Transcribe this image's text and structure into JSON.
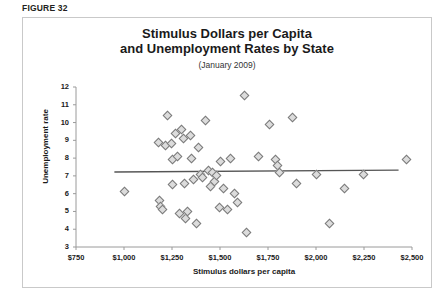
{
  "figure": {
    "label": "FIGURE 32"
  },
  "chart_data": {
    "type": "scatter",
    "title_line1": "Stimulus Dollars per Capita",
    "title_line2": "and Unemployment Rates by State",
    "subtitle": "(January 2009)",
    "xlabel": "Stimulus dollars per capita",
    "ylabel": "Unemployment rate",
    "xlim": [
      750,
      2500
    ],
    "ylim": [
      3,
      12
    ],
    "grid": false,
    "legend": "none",
    "xticks": [
      750,
      1000,
      1250,
      1500,
      1750,
      2000,
      2250,
      2500
    ],
    "xtick_labels": [
      "$750",
      "$1,000",
      "$1,250",
      "$1,500",
      "$1,750",
      "$2,000",
      "$2,250",
      "$2,500"
    ],
    "yticks": [
      3,
      4,
      5,
      6,
      7,
      8,
      9,
      10,
      11,
      12
    ],
    "ytick_labels": [
      "3",
      "4",
      "5",
      "6",
      "7",
      "8",
      "9",
      "10",
      "11",
      "12"
    ],
    "marker_shape": "diamond",
    "marker_fill": "#dcdcdc",
    "marker_edge": "#7a7a7a",
    "trendline": {
      "type": "linear",
      "color": "#555555",
      "x_start": 950,
      "y_start": 7.22,
      "x_end": 2430,
      "y_end": 7.32
    },
    "points": [
      {
        "x": 1000,
        "y": 6.1
      },
      {
        "x": 1180,
        "y": 8.9
      },
      {
        "x": 1185,
        "y": 5.6
      },
      {
        "x": 1190,
        "y": 5.3
      },
      {
        "x": 1200,
        "y": 5.1
      },
      {
        "x": 1215,
        "y": 8.7
      },
      {
        "x": 1225,
        "y": 10.4
      },
      {
        "x": 1245,
        "y": 8.8
      },
      {
        "x": 1250,
        "y": 7.9
      },
      {
        "x": 1255,
        "y": 6.5
      },
      {
        "x": 1270,
        "y": 9.4
      },
      {
        "x": 1280,
        "y": 8.1
      },
      {
        "x": 1290,
        "y": 4.9
      },
      {
        "x": 1300,
        "y": 9.6
      },
      {
        "x": 1310,
        "y": 9.1
      },
      {
        "x": 1315,
        "y": 6.6
      },
      {
        "x": 1320,
        "y": 4.6
      },
      {
        "x": 1330,
        "y": 5.0
      },
      {
        "x": 1345,
        "y": 9.3
      },
      {
        "x": 1350,
        "y": 8.0
      },
      {
        "x": 1360,
        "y": 6.8
      },
      {
        "x": 1375,
        "y": 4.3
      },
      {
        "x": 1390,
        "y": 8.6
      },
      {
        "x": 1400,
        "y": 7.1
      },
      {
        "x": 1410,
        "y": 6.9
      },
      {
        "x": 1425,
        "y": 10.1
      },
      {
        "x": 1440,
        "y": 7.3
      },
      {
        "x": 1450,
        "y": 6.4
      },
      {
        "x": 1460,
        "y": 7.2
      },
      {
        "x": 1470,
        "y": 6.7
      },
      {
        "x": 1480,
        "y": 7.0
      },
      {
        "x": 1495,
        "y": 5.2
      },
      {
        "x": 1505,
        "y": 7.8
      },
      {
        "x": 1520,
        "y": 6.3
      },
      {
        "x": 1540,
        "y": 5.1
      },
      {
        "x": 1555,
        "y": 8.0
      },
      {
        "x": 1575,
        "y": 6.0
      },
      {
        "x": 1590,
        "y": 5.5
      },
      {
        "x": 1625,
        "y": 11.5
      },
      {
        "x": 1640,
        "y": 3.8
      },
      {
        "x": 1700,
        "y": 8.1
      },
      {
        "x": 1760,
        "y": 9.9
      },
      {
        "x": 1790,
        "y": 7.9
      },
      {
        "x": 1800,
        "y": 7.6
      },
      {
        "x": 1810,
        "y": 7.2
      },
      {
        "x": 1875,
        "y": 10.3
      },
      {
        "x": 1900,
        "y": 6.6
      },
      {
        "x": 2000,
        "y": 7.1
      },
      {
        "x": 2070,
        "y": 4.3
      },
      {
        "x": 2150,
        "y": 6.3
      },
      {
        "x": 2245,
        "y": 7.1
      },
      {
        "x": 2470,
        "y": 7.9
      }
    ]
  }
}
